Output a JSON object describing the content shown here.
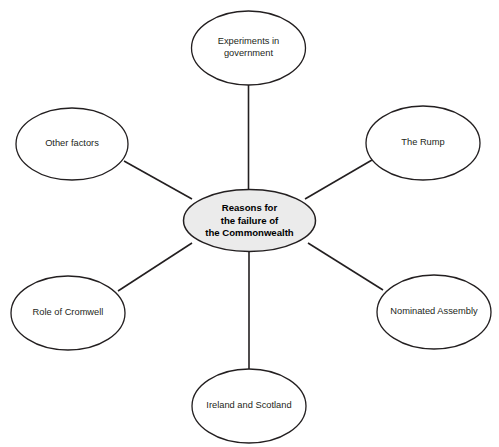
{
  "diagram": {
    "type": "spider-mind-map",
    "canvas": {
      "width": 499,
      "height": 447,
      "background": "#ffffff"
    },
    "colors": {
      "stroke": "#231f20",
      "center_fill": "#ebebeb",
      "node_fill": "#ffffff",
      "text": "#231f20"
    },
    "center": {
      "id": "center",
      "lines": [
        "Reasons for",
        "the failure of",
        "the Commonwealth"
      ],
      "cx": 249.5,
      "cy": 220.5,
      "rx": 66,
      "ry": 31
    },
    "nodes": [
      {
        "id": "experiments-in-government",
        "lines": [
          "Experiments in",
          "government"
        ],
        "cx": 248.5,
        "cy": 48,
        "rx": 57,
        "ry": 37
      },
      {
        "id": "the-rump",
        "lines": [
          "The Rump"
        ],
        "cx": 423,
        "cy": 143,
        "rx": 57,
        "ry": 37
      },
      {
        "id": "nominated-assembly",
        "lines": [
          "Nominated Assembly"
        ],
        "cx": 434,
        "cy": 312,
        "rx": 57,
        "ry": 37
      },
      {
        "id": "ireland-and-scotland",
        "lines": [
          "Ireland and Scotland"
        ],
        "cx": 249,
        "cy": 406,
        "rx": 57,
        "ry": 37
      },
      {
        "id": "role-of-cromwell",
        "lines": [
          "Role of Cromwell"
        ],
        "cx": 68,
        "cy": 313,
        "rx": 57,
        "ry": 37
      },
      {
        "id": "other-factors",
        "lines": [
          "Other factors"
        ],
        "cx": 72,
        "cy": 144,
        "rx": 56,
        "ry": 36
      }
    ],
    "connectors": [
      {
        "id": "center-to-experiments-in-government",
        "x1": 248.5,
        "y1": 190,
        "x2": 248.5,
        "y2": 85
      },
      {
        "id": "center-to-the-rump",
        "x1": 305,
        "y1": 199,
        "x2": 372,
        "y2": 160
      },
      {
        "id": "center-to-nominated-assembly",
        "x1": 308,
        "y1": 243,
        "x2": 383,
        "y2": 290
      },
      {
        "id": "center-to-ireland-and-scotland",
        "x1": 249,
        "y1": 251,
        "x2": 249,
        "y2": 370
      },
      {
        "id": "center-to-role-of-cromwell",
        "x1": 192,
        "y1": 243,
        "x2": 118,
        "y2": 291
      },
      {
        "id": "center-to-other-factors",
        "x1": 192,
        "y1": 199,
        "x2": 124,
        "y2": 161
      }
    ]
  }
}
